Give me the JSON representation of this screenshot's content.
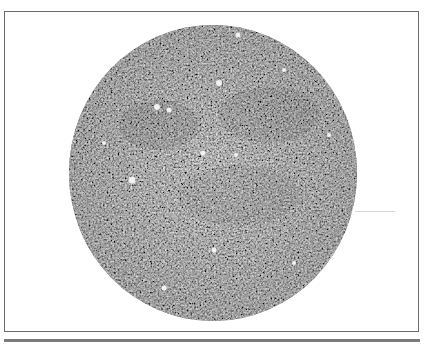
{
  "image": {
    "description": "Grayscale micrograph of a circular field with granular speckled texture",
    "frame_border_color": "#6b6b6b",
    "disc_base_color": "#7d7d7d",
    "speckle_light_color": "#e6e6e6",
    "speckle_dark_color": "#3a3a3a"
  }
}
